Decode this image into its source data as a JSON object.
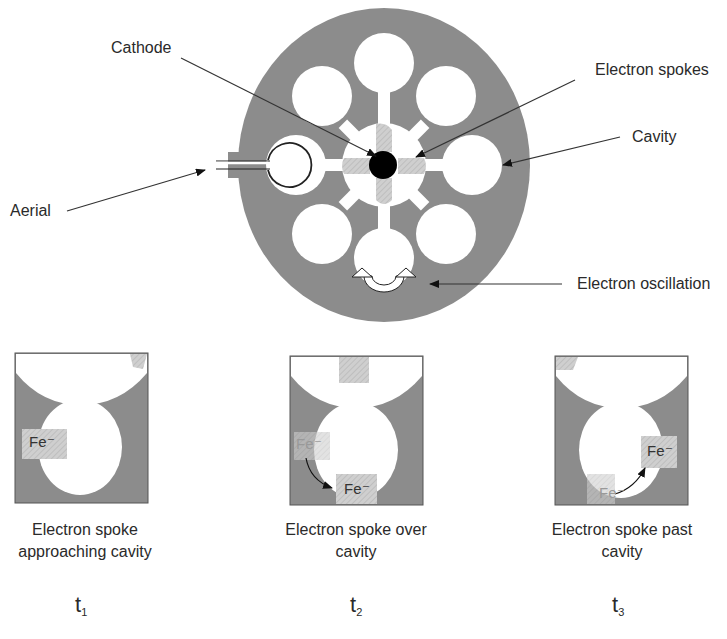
{
  "labels": {
    "cathode": "Cathode",
    "electron_spokes": "Electron spokes",
    "cavity": "Cavity",
    "aerial": "Aerial",
    "electron_oscillation": "Electron oscillation"
  },
  "panels": [
    {
      "caption_line1": "Electron spoke",
      "caption_line2": "approaching cavity",
      "time_base": "t",
      "time_sub": "1",
      "charge_label": "Fe⁻"
    },
    {
      "caption_line1": "Electron spoke over",
      "caption_line2": "cavity",
      "time_base": "t",
      "time_sub": "2",
      "charge_label_ghost": "Fe⁻",
      "charge_label": "Fe⁻"
    },
    {
      "caption_line1": "Electron spoke past",
      "caption_line2": "cavity",
      "time_base": "t",
      "time_sub": "3",
      "charge_label_ghost": "Fe⁻",
      "charge_label": "Fe⁻"
    }
  ],
  "colors": {
    "body_gray": "#8c8c8c",
    "spoke_hatch": "#c8c8c8",
    "cathode": "#000000",
    "line": "#333333"
  }
}
